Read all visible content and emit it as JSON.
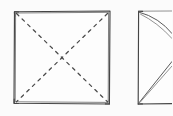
{
  "figure": {
    "kind": "origami-fold-diagram",
    "background_color": "#fbfbfb",
    "ink_color": "#454545",
    "dashed_fold_color": "#4a4a4a",
    "width": 172,
    "height": 116,
    "panel_count": 2
  },
  "panels": [
    {
      "id": "panel-left",
      "name": "square-with-diagonal-creases",
      "description": "Hand-drawn square sheet of paper with two dashed diagonal fold lines forming an X",
      "outline_label": "square sheet",
      "corners": {
        "top_left": [
          14,
          11
        ],
        "top_right": [
          110,
          11
        ],
        "bottom_right": [
          110,
          104
        ],
        "bottom_left": [
          14,
          104
        ]
      },
      "outline_path": "M14.5 11.5 L110 11 L109.5 104 L14 103.5 Z",
      "outline_path_double": "M15.5 12.8 L109 12.4 L108.6 102.6 L15.4 102.2 Z",
      "fold_lines": [
        {
          "name": "diagonal-fold-tl-br",
          "style": "dashed",
          "from": [
            16,
            13
          ],
          "to": [
            108,
            102
          ]
        },
        {
          "name": "diagonal-fold-tr-bl",
          "style": "dashed",
          "from": [
            108,
            13
          ],
          "to": [
            16,
            102
          ]
        }
      ],
      "center_point": [
        62,
        57.5
      ]
    },
    {
      "id": "panel-right",
      "name": "folded-result-partial",
      "description": "Partially visible second figure: folded form with a straight left edge and converging diagonal creases meeting at the right, clipped by the image border",
      "outline_label": "folded sheet",
      "left_edge": {
        "from": [
          138,
          11
        ],
        "to": [
          138,
          104
        ]
      },
      "creases": [
        {
          "name": "crease-top-sweep-outer",
          "from": [
            139,
            12
          ],
          "control": [
            160,
            18
          ],
          "to": [
            172,
            34
          ]
        },
        {
          "name": "crease-top-sweep-inner",
          "from": [
            140,
            14
          ],
          "control": [
            158,
            22
          ],
          "to": [
            172,
            38
          ]
        },
        {
          "name": "crease-top-edge",
          "from": [
            139,
            11
          ],
          "to": [
            172,
            11
          ]
        },
        {
          "name": "crease-bottom-diagonal-outer",
          "from": [
            139,
            103
          ],
          "to": [
            172,
            62
          ]
        },
        {
          "name": "crease-bottom-diagonal-inner",
          "from": [
            140,
            102
          ],
          "to": [
            172,
            66
          ]
        },
        {
          "name": "crease-bottom-edge",
          "from": [
            139,
            104
          ],
          "to": [
            172,
            104
          ]
        }
      ]
    }
  ],
  "annotations": {
    "labels": [],
    "step_number": "",
    "caption": ""
  }
}
